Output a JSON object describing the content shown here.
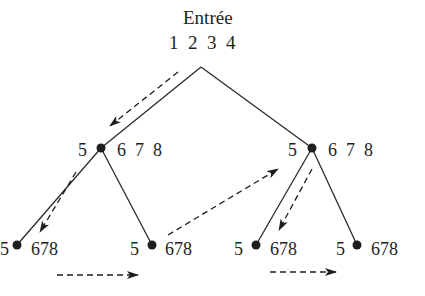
{
  "diagram": {
    "title": "Entrée",
    "input_values": "1  2  3  4",
    "colors": {
      "ink": "#1e1e1e",
      "background": "#ffffff"
    },
    "nodes": {
      "mid_left": {
        "left_label": "5",
        "right_label": "6  7  8"
      },
      "mid_right": {
        "left_label": "5",
        "right_label": "6  7  8"
      },
      "leaf_1": {
        "left_label": "5",
        "right_label": "678"
      },
      "leaf_2": {
        "left_label": "5",
        "right_label": "678"
      },
      "leaf_3": {
        "left_label": "5",
        "right_label": "678"
      },
      "leaf_4": {
        "left_label": "5",
        "right_label": "678"
      }
    },
    "edges": [
      {
        "from": "root",
        "to": "mid_left"
      },
      {
        "from": "root",
        "to": "mid_right"
      },
      {
        "from": "mid_left",
        "to": "leaf_1"
      },
      {
        "from": "mid_left",
        "to": "leaf_2"
      },
      {
        "from": "mid_right",
        "to": "leaf_3"
      },
      {
        "from": "mid_right",
        "to": "leaf_4"
      }
    ],
    "traversal_arrows": [
      {
        "from": "root",
        "to": "mid_left",
        "style": "dashed"
      },
      {
        "from": "mid_left",
        "to": "leaf_1",
        "style": "dashed"
      },
      {
        "from": "leaf_1",
        "to": "leaf_2",
        "style": "dashed"
      },
      {
        "from": "leaf_2",
        "to": "mid_right",
        "style": "dashed"
      },
      {
        "from": "mid_right",
        "to": "leaf_3",
        "style": "dashed"
      },
      {
        "from": "leaf_3",
        "to": "leaf_4",
        "style": "dashed"
      }
    ]
  }
}
